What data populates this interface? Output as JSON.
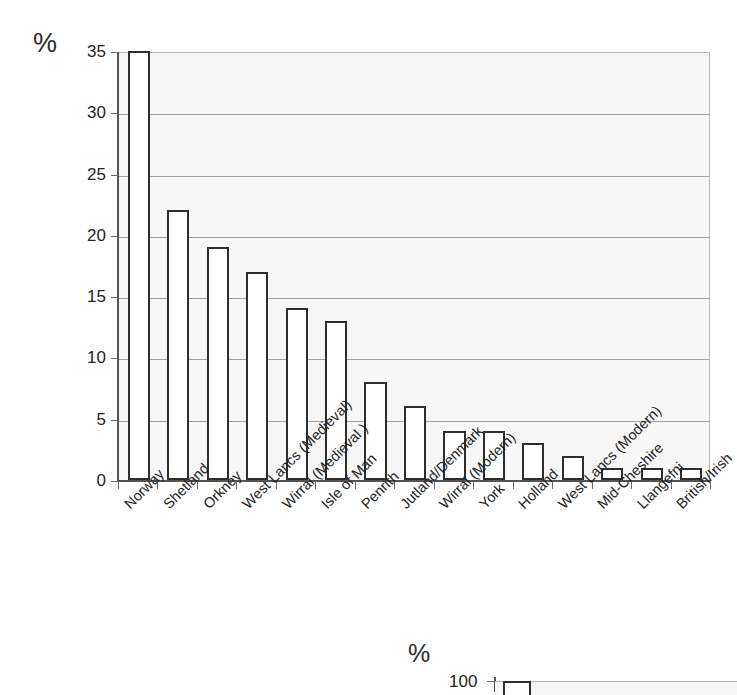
{
  "chart_data": {
    "type": "bar",
    "title": "",
    "subtitle": "",
    "xlabel": "",
    "ylabel": "%",
    "ylim": [
      0,
      35
    ],
    "yticks": [
      0,
      5,
      10,
      15,
      20,
      25,
      30,
      35
    ],
    "grid": true,
    "legend": null,
    "categories": [
      "Norway",
      "Shetland",
      "Orkney",
      "West Lancs (Medieval)",
      "Wirral (Medieval )",
      "Isle of Man",
      "Penrith",
      "Jutland/Denmark",
      "Wirral (Modern)",
      "York",
      "Holland",
      "West Lancs (Modern)",
      "Mid-Cheshire",
      "Llangefni",
      "British/Irish"
    ],
    "values": [
      35,
      22,
      19,
      17,
      14,
      13,
      8,
      6,
      4,
      4,
      3,
      2,
      1,
      1,
      1
    ],
    "bar_fill": "#ffffff",
    "bar_edge": "#2e2e2e",
    "plot_background": "#f7f7f7",
    "gridline_color": "#a0a0a0",
    "axis_color": "#545454"
  },
  "secondary_chart": {
    "type": "bar",
    "ylabel": "%",
    "visible_ytick": "100",
    "note_cropped": true
  }
}
